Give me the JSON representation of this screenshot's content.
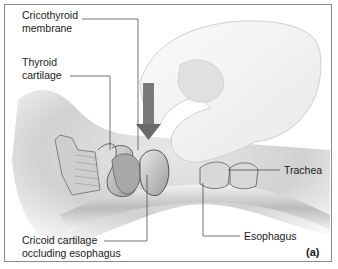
{
  "figure": {
    "panel_label": "(a)",
    "arrow_color": "#7a7a7a",
    "labels": {
      "cricothyroid": "Cricothyroid\nmembrane",
      "thyroid": "Thyroid\ncartilage",
      "cricoid": "Cricoid cartilage\noccluding esophagus",
      "trachea": "Trachea",
      "esophagus": "Esophagus"
    }
  }
}
